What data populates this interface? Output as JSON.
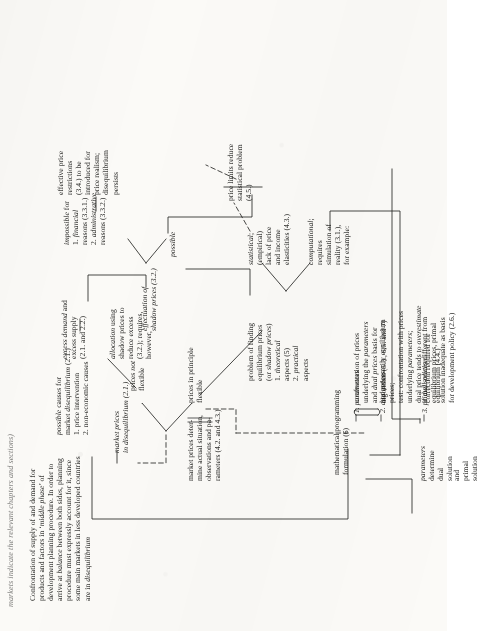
{
  "page": {
    "running_head": "markets indicate the relevant chapters and sections)",
    "orientation": "rotated-90-ccw",
    "ink_color": "#20201e",
    "paper_color": "#fbfaf7"
  },
  "nodes": {
    "root": "Confrontation of supply of and demand for\nproducts and factors in ‘middle phase’ of\ndevelopment planning procedure. In order to\narrive at balance between both sides, planning\nprocedure must expressly account for it, since\nsome main markets in less developed countries\nare in disequilibrium",
    "causes": "possible causes for\nmarket disequilibrium (2.1.)\n1. price intervention\n2. non-economic causes",
    "market_prices_diseq": "market prices\nin disequilibrium (2.1.)",
    "prices_flexible": "prices in principle\nflexible",
    "prices_not_flexible": "prices not\nflexible",
    "excess": "excess demand and\nexcess supply\n(2.1. and 2.2.)",
    "allocation": "allocation using\nshadow prices to\nreduce excess\n(3.2.); requires,\nhowever,",
    "effectuation": "effectuation of\nshadow prices (3.2.)",
    "possible": "possible",
    "impossible": "impossible for\n1. financial\n    reasons (3.3.1.)\n2. administrative\n    reasons (3.3.2.)",
    "effective_restrictions": "effective price\nrestrictions\n(3.4.) to be\nintroduced for\nprice realism;\ndisequilibrium\npersists",
    "market_prices_determine": "market  prices  deter-\nmine actual situation,\nobservations  and  pa-\nrameters (4.2. and 4.3.)",
    "problem_finding": "problem  of  finding\nequilibrium prices\n(or shadow prices)\n1. theoretical\n    aspects (5)\n2. practical\n    aspects",
    "computational": "computational;\nrequires\nsimulation of\nreality (3.1.),\nfor example:",
    "statistical": "statistical;\n(empirical)\nlack of price\nand income\nelasticities (4.3.)",
    "price_limits": "price limits reduce\nstatistical problem\n(4.5.)",
    "math_programming": "mathematical programming\nformulation (6)",
    "item1_label": "1. parameters",
    "item1_body": "confrontation of prices\nunderlying the parameters\nand dual prices basis for\nalgorithm (5.3., 6.5. and 7)",
    "item2_label": "2. dual prices",
    "item2_body": "not necessarily equilibrium\nprices;\ntest: confrontation with prices\nunderlying parameters;\ndual price tends to overestimate\ncorrection required for\nequilibrium (4.4.)",
    "item3_label": "3. primal solution",
    "item3_body": "if dual prices different from\nequilibrium prices, primal\nsolution inadequate as basis\nfor development policy (2.6.)",
    "brace_label_1": "parameters\ndetermine\ndual\nsolution",
    "brace_label_2": "and\nprimal\nsolution"
  },
  "italic_terms": [
    "market disequilibrium",
    "market prices",
    "disequilibrium",
    "balance",
    "middle phase",
    "excess demand",
    "excess supply",
    "allocation",
    "shadow prices",
    "effectuation",
    "possible",
    "impossible",
    "financial",
    "administrative",
    "effective price restrictions",
    "price realism",
    "equilibrium prices",
    "theoretical",
    "practical",
    "computational",
    "simulation",
    "statistical",
    "parameters",
    "dual prices",
    "algorithm",
    "not",
    "overestimate",
    "primal solution"
  ]
}
